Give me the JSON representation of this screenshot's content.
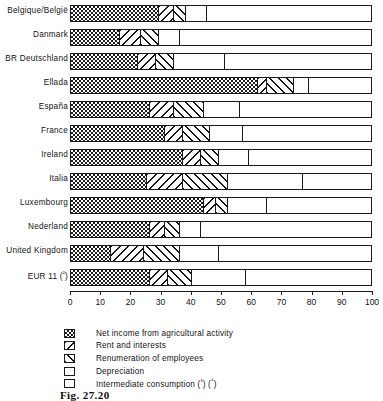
{
  "figure": {
    "caption": "Fig. 27.20"
  },
  "chart_data": {
    "type": "bar",
    "orientation": "horizontal",
    "stacked": true,
    "title": "",
    "xlabel": "",
    "ylabel": "",
    "xlim": [
      0,
      100
    ],
    "xticks": [
      0,
      10,
      20,
      30,
      40,
      50,
      60,
      70,
      80,
      90,
      100
    ],
    "xtick_labels": [
      "0",
      "10",
      "20",
      "30",
      "40",
      "50",
      "60",
      "70",
      "80",
      "90",
      "100"
    ],
    "grid": false,
    "legend_position": "below-axis",
    "categories": [
      "Belgique/België",
      "Danmark",
      "BR Deutschland",
      "Ellada",
      "España",
      "France",
      "Ireland",
      "Italia",
      "Luxembourg",
      "Nederland",
      "United Kingdom",
      "EUR 11 (²)"
    ],
    "series": [
      {
        "name": "Net income from agricultural activity",
        "pattern": "checkerboard",
        "values": [
          29,
          16,
          22,
          62,
          26,
          31,
          37,
          25,
          44,
          26,
          13,
          26
        ]
      },
      {
        "name": "Rent and interests",
        "pattern": "diagonal-back",
        "values": [
          5,
          7,
          6,
          3,
          8,
          6,
          6,
          12,
          4,
          5,
          11,
          6
        ]
      },
      {
        "name": "Renumeration of employees",
        "pattern": "diagonal-forward",
        "values": [
          4,
          6,
          6,
          9,
          10,
          9,
          6,
          15,
          4,
          5,
          12,
          8
        ]
      },
      {
        "name": "Depreciation",
        "pattern": "dotted",
        "values": [
          7,
          7,
          17,
          5,
          12,
          11,
          10,
          25,
          13,
          7,
          13,
          18
        ]
      },
      {
        "name": "Intermediate consumption (³) (⁴)",
        "pattern": "blank",
        "values": [
          55,
          64,
          49,
          21,
          44,
          43,
          41,
          23,
          35,
          57,
          51,
          42
        ]
      }
    ]
  },
  "legend": {
    "items": [
      {
        "label": "Net income from agricultural activity",
        "pattern": "checkerboard"
      },
      {
        "label": "Rent and interests",
        "pattern": "diagonal-back"
      },
      {
        "label": "Renumeration of employees",
        "pattern": "diagonal-forward"
      },
      {
        "label": "Depreciation",
        "pattern": "dotted"
      },
      {
        "label": "Intermediate consumption (³) (⁴)",
        "pattern": "blank"
      }
    ]
  }
}
